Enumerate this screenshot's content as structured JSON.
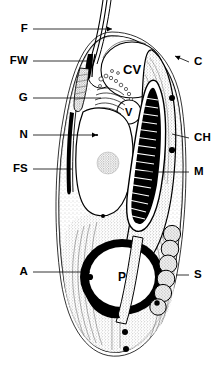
{
  "figure": {
    "kind": "biological-cell-cross-section",
    "background_color": "#ffffff",
    "ink_color": "#000000",
    "width": 222,
    "height": 377
  },
  "labels": {
    "left": [
      {
        "key": "F",
        "text": "F",
        "x": 28,
        "y": 29,
        "leader_to_x": 112,
        "leader_to_y": 29,
        "arrow": true
      },
      {
        "key": "FW",
        "text": "FW",
        "x": 28,
        "y": 61,
        "leader_to_x": 88,
        "leader_to_y": 61,
        "arrow": false
      },
      {
        "key": "G",
        "text": "G",
        "x": 28,
        "y": 98,
        "leader_to_x": 101,
        "leader_to_y": 98,
        "arrow": false
      },
      {
        "key": "N",
        "text": "N",
        "x": 28,
        "y": 135,
        "leader_to_x": 97,
        "leader_to_y": 135,
        "arrow": true
      },
      {
        "key": "FS",
        "text": "FS",
        "x": 28,
        "y": 169,
        "leader_to_x": 72,
        "leader_to_y": 169,
        "arrow": false
      },
      {
        "key": "A",
        "text": "A",
        "x": 28,
        "y": 272,
        "leader_to_x": 90,
        "leader_to_y": 272,
        "arrow": true
      }
    ],
    "right": [
      {
        "key": "C",
        "text": "C",
        "x": 194,
        "y": 62,
        "leader_to_x": 175,
        "leader_to_y": 56,
        "arrow": true
      },
      {
        "key": "CH",
        "text": "CH",
        "x": 194,
        "y": 138,
        "leader_to_x": 172,
        "leader_to_y": 134,
        "arrow": false
      },
      {
        "key": "M",
        "text": "M",
        "x": 194,
        "y": 172,
        "leader_to_x": 142,
        "leader_to_y": 172,
        "arrow": false
      },
      {
        "key": "S",
        "text": "S",
        "x": 194,
        "y": 275,
        "leader_to_x": 176,
        "leader_to_y": 275,
        "arrow": false
      }
    ],
    "inner": [
      {
        "key": "CV",
        "text": "CV",
        "x": 123,
        "y": 69,
        "size": 13
      },
      {
        "key": "V",
        "text": "V",
        "x": 125,
        "y": 112,
        "size": 11
      },
      {
        "key": "P",
        "text": "P",
        "x": 118,
        "y": 277,
        "size": 12
      }
    ]
  },
  "legend_meaning": {
    "F": "flagellum",
    "FW": "flagellar wall / flagellar base",
    "G": "golgi apparatus",
    "N": "nucleus",
    "FS": "flagellar sheath",
    "A": "anterior cytoplasm",
    "C": "cell membrane / cortex",
    "CH": "chloroplast",
    "M": "mitochondrion",
    "S": "storage granules",
    "CV": "contractile vacuole",
    "V": "vacuole",
    "P": "pyrenoid"
  },
  "structures": {
    "cell_outline": {
      "name": "cell-body-outline",
      "stroke": "#000000"
    },
    "contractile_vacuole": {
      "name": "contractile-vacuole",
      "fill": "#ffffff"
    },
    "small_vacuole": {
      "name": "small-vacuole",
      "fill": "#ffffff"
    },
    "nucleus": {
      "name": "nucleus",
      "fill": "#ffffff"
    },
    "nucleolus": {
      "name": "nucleolus",
      "fill": "stippled"
    },
    "golgi": {
      "name": "golgi-apparatus"
    },
    "mitochondrion": {
      "name": "mitochondrion",
      "fill": "#000000"
    },
    "chloroplast": {
      "name": "chloroplast",
      "fill": "stippled"
    },
    "pyrenoid": {
      "name": "pyrenoid-ring",
      "fill": "#000000"
    },
    "storage_granules": {
      "name": "storage-granule",
      "count": 6
    },
    "flagellum": {
      "name": "flagellum"
    },
    "granule_dots": {
      "name": "dark-granule-dot",
      "count": 7
    }
  }
}
